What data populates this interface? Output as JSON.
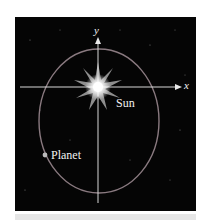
{
  "diagram": {
    "labels": {
      "y_axis": "y",
      "x_axis": "x",
      "sun": "Sun",
      "planet": "Planet"
    },
    "colors": {
      "background": "#050505",
      "orbit": "#8a7a80",
      "axes": "#d8d8d8",
      "sun": "#ffffff",
      "planet": "#bbbbbb"
    }
  }
}
